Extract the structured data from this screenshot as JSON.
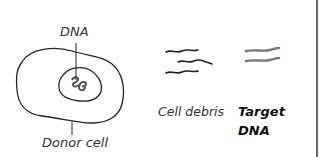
{
  "diagram": {
    "labels": {
      "dna": "DNA",
      "donor_cell": "Donor cell",
      "cell_debris": "Cell debris",
      "target_line1": "Target",
      "target_line2": "DNA"
    },
    "colors": {
      "stroke": "#222222",
      "target_stroke": "#777777",
      "border": "#666666",
      "background": "#ffffff"
    },
    "elements": [
      {
        "id": "donor-cell",
        "type": "cell-outline"
      },
      {
        "id": "nucleus",
        "type": "nucleus-outline"
      },
      {
        "id": "dna-coil",
        "type": "squiggle"
      },
      {
        "id": "cell-debris",
        "type": "wavy-lines",
        "count": 3
      },
      {
        "id": "target-dna",
        "type": "parallel-wavy-lines",
        "count": 2
      }
    ]
  }
}
